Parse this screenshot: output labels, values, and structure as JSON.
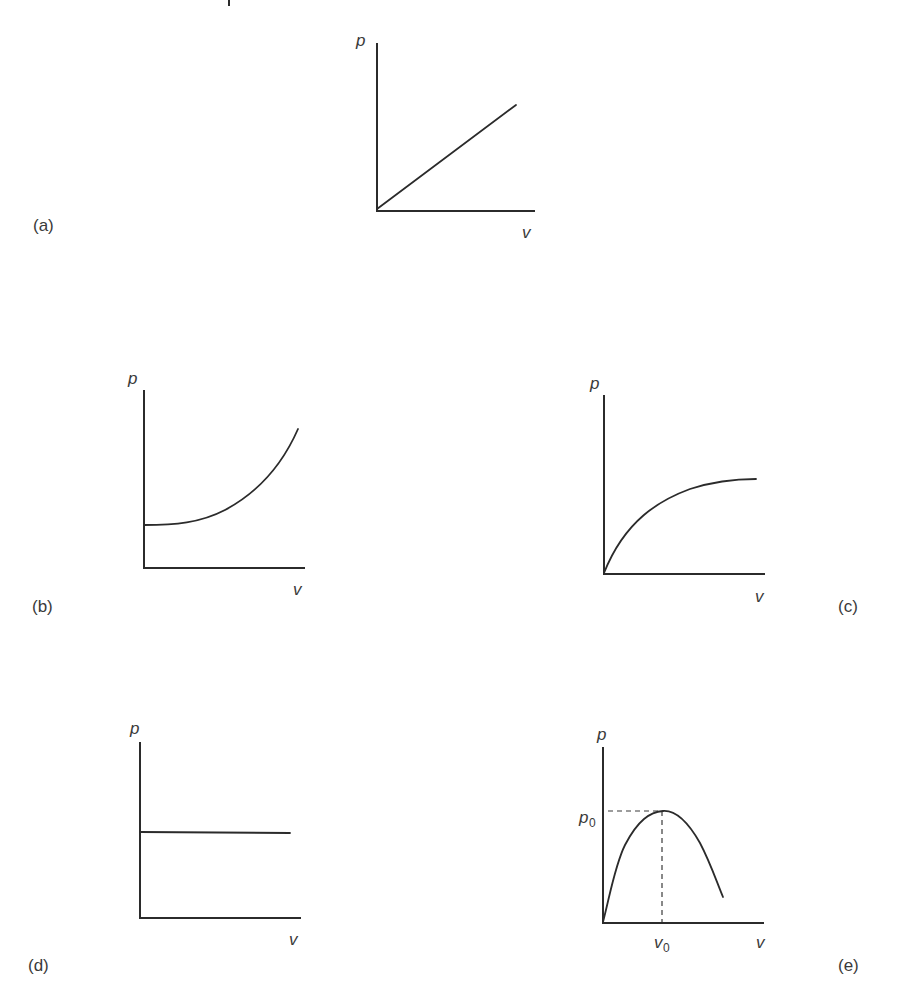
{
  "figure": {
    "panels": [
      {
        "id": "a",
        "label": "(a)",
        "y_axis_label": "p",
        "x_axis_label": "v",
        "curve_shape": "linear increasing from origin"
      },
      {
        "id": "b",
        "label": "(b)",
        "y_axis_label": "p",
        "x_axis_label": "v",
        "curve_shape": "starts at positive intercept, flat then rising steeply (convex)"
      },
      {
        "id": "c",
        "label": "(c)",
        "y_axis_label": "p",
        "x_axis_label": "v",
        "curve_shape": "rises from origin and saturates to a plateau (concave)"
      },
      {
        "id": "d",
        "label": "(d)",
        "y_axis_label": "p",
        "x_axis_label": "v",
        "curve_shape": "constant horizontal line"
      },
      {
        "id": "e",
        "label": "(e)",
        "y_axis_label": "p",
        "x_axis_label": "v",
        "peak_y_label_main": "p",
        "peak_y_label_sub": "0",
        "peak_x_label_main": "v",
        "peak_x_label_sub": "0",
        "curve_shape": "rises from origin to maximum p0 at v0 then falls"
      }
    ]
  }
}
